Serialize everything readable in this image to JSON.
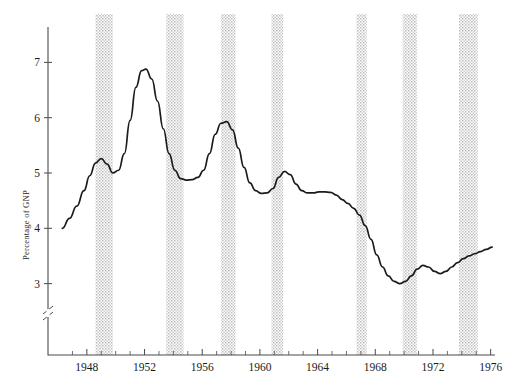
{
  "chart_data": {
    "type": "line",
    "title": "",
    "subtitle": "",
    "xlabel": "",
    "ylabel": "Percentage of GNP",
    "xlim": [
      1946.0,
      1976.3
    ],
    "ylim": [
      2.55,
      7.45
    ],
    "grid": false,
    "legend": null,
    "y_ticks": [
      3,
      4,
      5,
      6,
      7
    ],
    "y_tick_labels": [
      "3",
      "4",
      "5",
      "6",
      "7"
    ],
    "y_axis_break": true,
    "y_axis_break_note": "double-slash break between 3 and the axis origin",
    "x_ticks": [
      1947,
      1948,
      1949,
      1950,
      1951,
      1952,
      1953,
      1954,
      1955,
      1956,
      1957,
      1958,
      1959,
      1960,
      1961,
      1962,
      1963,
      1964,
      1965,
      1966,
      1967,
      1968,
      1969,
      1970,
      1971,
      1972,
      1973,
      1974,
      1975,
      1976
    ],
    "x_tick_labels": [
      "1948",
      "1952",
      "1956",
      "1960",
      "1964",
      "1968",
      "1972",
      "1976"
    ],
    "x_labeled_ticks": [
      1948,
      1952,
      1956,
      1960,
      1964,
      1968,
      1972,
      1976
    ],
    "series": [
      {
        "name": "Percentage of GNP",
        "color": "#1b1b1b",
        "x": [
          1946.3,
          1946.8,
          1947.3,
          1947.8,
          1948.2,
          1948.6,
          1949.0,
          1949.4,
          1949.8,
          1950.2,
          1950.6,
          1951.0,
          1951.4,
          1951.8,
          1952.1,
          1952.5,
          1952.9,
          1953.3,
          1953.7,
          1954.1,
          1954.5,
          1954.9,
          1955.3,
          1955.7,
          1956.1,
          1956.5,
          1956.9,
          1957.3,
          1957.7,
          1958.1,
          1958.5,
          1958.9,
          1959.3,
          1959.7,
          1960.1,
          1960.5,
          1960.9,
          1961.3,
          1961.7,
          1962.1,
          1962.5,
          1962.9,
          1963.3,
          1963.7,
          1964.1,
          1964.5,
          1964.9,
          1965.3,
          1965.7,
          1966.1,
          1966.5,
          1966.9,
          1967.3,
          1967.7,
          1968.1,
          1968.5,
          1968.9,
          1969.3,
          1969.7,
          1970.1,
          1970.5,
          1970.9,
          1971.3,
          1971.7,
          1972.1,
          1972.5,
          1972.9,
          1973.3,
          1973.7,
          1974.1,
          1974.5,
          1974.9,
          1975.3,
          1975.7,
          1976.1
        ],
        "y": [
          4.0,
          4.18,
          4.4,
          4.68,
          4.95,
          5.18,
          5.26,
          5.16,
          5.0,
          5.05,
          5.35,
          5.95,
          6.55,
          6.85,
          6.88,
          6.7,
          6.3,
          5.8,
          5.35,
          5.05,
          4.9,
          4.87,
          4.88,
          4.92,
          5.05,
          5.35,
          5.7,
          5.9,
          5.93,
          5.78,
          5.45,
          5.1,
          4.82,
          4.68,
          4.63,
          4.64,
          4.72,
          4.92,
          5.03,
          4.97,
          4.8,
          4.68,
          4.64,
          4.64,
          4.66,
          4.66,
          4.65,
          4.6,
          4.52,
          4.45,
          4.36,
          4.24,
          4.05,
          3.8,
          3.52,
          3.3,
          3.14,
          3.04,
          3.0,
          3.04,
          3.14,
          3.26,
          3.33,
          3.3,
          3.22,
          3.18,
          3.22,
          3.3,
          3.38,
          3.45,
          3.5,
          3.54,
          3.58,
          3.62,
          3.66
        ]
      }
    ],
    "shaded_bands": {
      "label": "recession-bands",
      "fill": "#d9d9d9",
      "texture": "stipple",
      "intervals": [
        {
          "start": 1948.6,
          "end": 1949.8
        },
        {
          "start": 1953.5,
          "end": 1954.7
        },
        {
          "start": 1957.3,
          "end": 1958.3
        },
        {
          "start": 1960.8,
          "end": 1961.6
        },
        {
          "start": 1966.7,
          "end": 1967.4
        },
        {
          "start": 1969.9,
          "end": 1970.9
        },
        {
          "start": 1973.8,
          "end": 1975.1
        }
      ]
    },
    "colors": {
      "line": "#1b1b1b",
      "axis": "#4a4a4a",
      "band": "#d9d9d9",
      "background": "#ffffff",
      "text": "#1a1a1a"
    }
  },
  "corner": {
    "mark": ""
  }
}
